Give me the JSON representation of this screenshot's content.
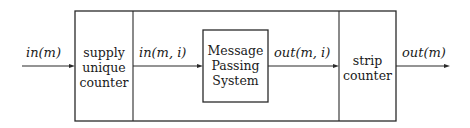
{
  "diagram": {
    "type": "block-diagram",
    "blocks": [
      {
        "id": "supply",
        "lines": [
          "supply",
          "unique",
          "counter"
        ]
      },
      {
        "id": "mps",
        "lines": [
          "Message",
          "Passing",
          "System"
        ]
      },
      {
        "id": "strip",
        "lines": [
          "strip",
          "counter"
        ]
      }
    ],
    "edges": [
      {
        "from": "input",
        "to": "supply",
        "label": "in(m)"
      },
      {
        "from": "supply",
        "to": "mps",
        "label": "in(m, i)"
      },
      {
        "from": "mps",
        "to": "strip",
        "label": "out(m, i)"
      },
      {
        "from": "strip",
        "to": "output",
        "label": "out(m)"
      }
    ]
  }
}
